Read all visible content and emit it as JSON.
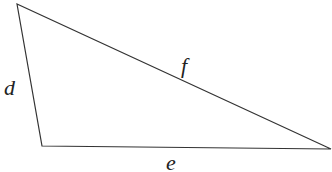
{
  "diagram": {
    "type": "triangle",
    "stroke_color": "#333333",
    "vertices": [
      {
        "x": 17,
        "y": 4
      },
      {
        "x": 42,
        "y": 146
      },
      {
        "x": 331,
        "y": 149
      }
    ],
    "sides": [
      {
        "label": "d",
        "x": 4,
        "y": 95
      },
      {
        "label": "f",
        "x": 181,
        "y": 73
      },
      {
        "label": "e",
        "x": 166,
        "y": 170
      }
    ]
  }
}
